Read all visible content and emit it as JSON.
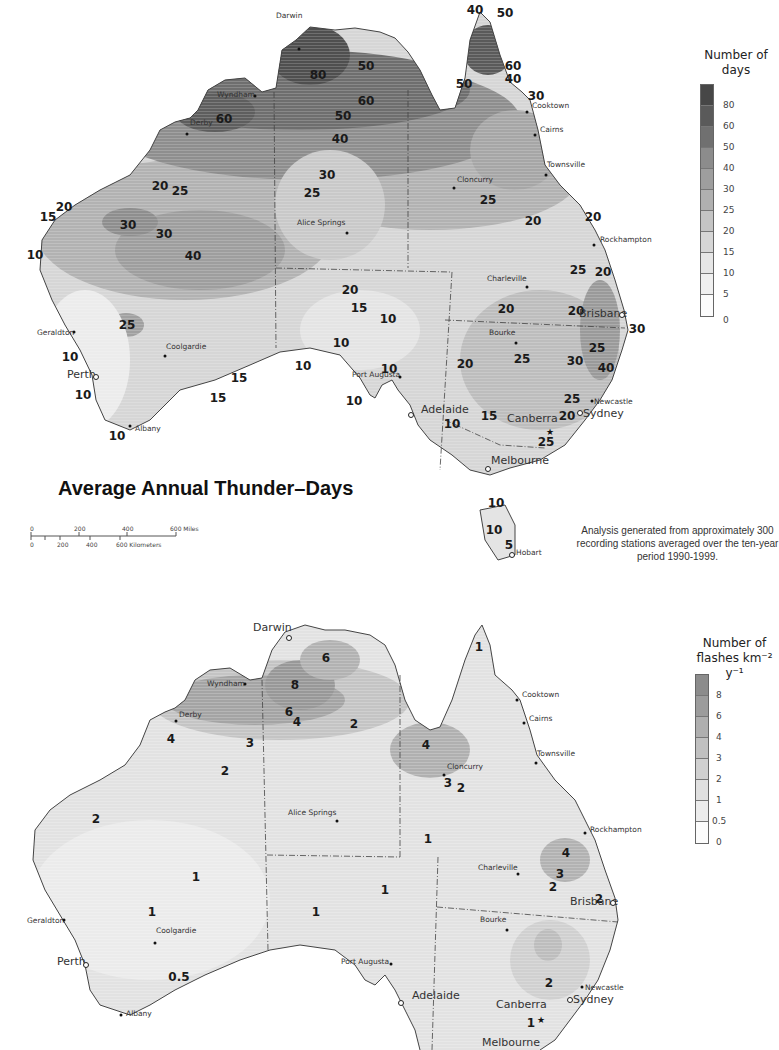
{
  "map1": {
    "title": "Average Annual Thunder–Days",
    "note": "Analysis generated from approximately 300 recording stations averaged over the ten-year period 1990-1999.",
    "legend": {
      "title_line1": "Number of",
      "title_line2": "days",
      "ticks": [
        "80",
        "60",
        "50",
        "40",
        "30",
        "25",
        "20",
        "15",
        "10",
        "5",
        "0"
      ],
      "colors": [
        "#4a4a4a",
        "#5c5c5c",
        "#6e6e6e",
        "#8a8a8a",
        "#9c9c9c",
        "#afafaf",
        "#c2c2c2",
        "#d4d4d4",
        "#e2e2e2",
        "#eeeeee",
        "#fafafa"
      ]
    },
    "scale_bar": {
      "miles_labels": [
        "0",
        "200",
        "400",
        "600 Miles"
      ],
      "km_labels": [
        "0",
        "200",
        "400",
        "600 Kilometers"
      ]
    },
    "contour_labels": [
      {
        "text": "80",
        "x": 318,
        "y": 75
      },
      {
        "text": "50",
        "x": 366,
        "y": 66
      },
      {
        "text": "60",
        "x": 366,
        "y": 101
      },
      {
        "text": "50",
        "x": 343,
        "y": 116
      },
      {
        "text": "40",
        "x": 340,
        "y": 139
      },
      {
        "text": "60",
        "x": 224,
        "y": 119
      },
      {
        "text": "30",
        "x": 327,
        "y": 175
      },
      {
        "text": "25",
        "x": 312,
        "y": 193
      },
      {
        "text": "20",
        "x": 160,
        "y": 186
      },
      {
        "text": "25",
        "x": 180,
        "y": 191
      },
      {
        "text": "20",
        "x": 64,
        "y": 207
      },
      {
        "text": "15",
        "x": 48,
        "y": 217
      },
      {
        "text": "30",
        "x": 128,
        "y": 225
      },
      {
        "text": "30",
        "x": 164,
        "y": 234
      },
      {
        "text": "10",
        "x": 35,
        "y": 255
      },
      {
        "text": "40",
        "x": 193,
        "y": 256
      },
      {
        "text": "40",
        "x": 475,
        "y": 10
      },
      {
        "text": "50",
        "x": 505,
        "y": 13
      },
      {
        "text": "60",
        "x": 513,
        "y": 66
      },
      {
        "text": "40",
        "x": 513,
        "y": 79
      },
      {
        "text": "50",
        "x": 464,
        "y": 84
      },
      {
        "text": "30",
        "x": 536,
        "y": 96
      },
      {
        "text": "25",
        "x": 488,
        "y": 200
      },
      {
        "text": "20",
        "x": 533,
        "y": 221
      },
      {
        "text": "20",
        "x": 593,
        "y": 217
      },
      {
        "text": "25",
        "x": 578,
        "y": 270
      },
      {
        "text": "20",
        "x": 603,
        "y": 272
      },
      {
        "text": "20",
        "x": 506,
        "y": 309
      },
      {
        "text": "20",
        "x": 576,
        "y": 311
      },
      {
        "text": "30",
        "x": 637,
        "y": 329
      },
      {
        "text": "25",
        "x": 597,
        "y": 348
      },
      {
        "text": "25",
        "x": 522,
        "y": 359
      },
      {
        "text": "30",
        "x": 575,
        "y": 361
      },
      {
        "text": "40",
        "x": 606,
        "y": 368
      },
      {
        "text": "20",
        "x": 465,
        "y": 364
      },
      {
        "text": "25",
        "x": 572,
        "y": 399
      },
      {
        "text": "20",
        "x": 567,
        "y": 416
      },
      {
        "text": "15",
        "x": 489,
        "y": 416
      },
      {
        "text": "10",
        "x": 452,
        "y": 424
      },
      {
        "text": "25",
        "x": 546,
        "y": 442
      },
      {
        "text": "20",
        "x": 350,
        "y": 290
      },
      {
        "text": "15",
        "x": 359,
        "y": 308
      },
      {
        "text": "10",
        "x": 388,
        "y": 319
      },
      {
        "text": "10",
        "x": 341,
        "y": 343
      },
      {
        "text": "10",
        "x": 303,
        "y": 366
      },
      {
        "text": "10",
        "x": 389,
        "y": 369
      },
      {
        "text": "10",
        "x": 354,
        "y": 401
      },
      {
        "text": "25",
        "x": 127,
        "y": 325
      },
      {
        "text": "10",
        "x": 70,
        "y": 357
      },
      {
        "text": "10",
        "x": 83,
        "y": 395
      },
      {
        "text": "15",
        "x": 239,
        "y": 378
      },
      {
        "text": "15",
        "x": 218,
        "y": 398
      },
      {
        "text": "10",
        "x": 117,
        "y": 436
      },
      {
        "text": "10",
        "x": 496,
        "y": 503
      },
      {
        "text": "10",
        "x": 494,
        "y": 530
      },
      {
        "text": "5",
        "x": 509,
        "y": 545
      }
    ],
    "cities": [
      {
        "name": "Darwin",
        "x": 276,
        "y": 16,
        "dx": 299,
        "dy": 49,
        "big": false
      },
      {
        "name": "Wyndham",
        "x": 217,
        "y": 95,
        "dx": 255,
        "dy": 96,
        "big": false
      },
      {
        "name": "Derby",
        "x": 190,
        "y": 123,
        "dx": 187,
        "dy": 134,
        "big": false
      },
      {
        "name": "Alice Springs",
        "x": 297,
        "y": 223,
        "dx": 347,
        "dy": 233,
        "big": false
      },
      {
        "name": "Cooktown",
        "x": 532,
        "y": 106,
        "dx": 527,
        "dy": 112,
        "big": false
      },
      {
        "name": "Cairns",
        "x": 540,
        "y": 130,
        "dx": 535,
        "dy": 135,
        "big": false
      },
      {
        "name": "Townsville",
        "x": 547,
        "y": 165,
        "dx": 546,
        "dy": 175,
        "big": false
      },
      {
        "name": "Cloncurry",
        "x": 457,
        "y": 180,
        "dx": 454,
        "dy": 188,
        "big": false
      },
      {
        "name": "Rockhampton",
        "x": 600,
        "y": 240,
        "dx": 594,
        "dy": 245,
        "big": false
      },
      {
        "name": "Charleville",
        "x": 487,
        "y": 279,
        "dx": 527,
        "dy": 287,
        "big": false
      },
      {
        "name": "Brisbane",
        "x": 579,
        "y": 314,
        "dx": 622,
        "dy": 315,
        "big": true,
        "ring": true
      },
      {
        "name": "Bourke",
        "x": 489,
        "y": 333,
        "dx": 516,
        "dy": 343,
        "big": false
      },
      {
        "name": "Geraldton",
        "x": 37,
        "y": 333,
        "dx": 74,
        "dy": 332,
        "big": false
      },
      {
        "name": "Coolgardie",
        "x": 166,
        "y": 347,
        "dx": 165,
        "dy": 356,
        "big": false
      },
      {
        "name": "Perth",
        "x": 67,
        "y": 375,
        "dx": 96,
        "dy": 377,
        "big": true,
        "ring": true
      },
      {
        "name": "Port Augusta",
        "x": 352,
        "y": 375,
        "dx": 400,
        "dy": 377,
        "big": false
      },
      {
        "name": "Adelaide",
        "x": 421,
        "y": 410,
        "dx": 411,
        "dy": 415,
        "big": true,
        "ring": true
      },
      {
        "name": "Newcastle",
        "x": 594,
        "y": 402,
        "dx": 592,
        "dy": 401,
        "big": false
      },
      {
        "name": "Sydney",
        "x": 583,
        "y": 414,
        "dx": 580,
        "dy": 413,
        "big": true,
        "ring": true
      },
      {
        "name": "Canberra",
        "x": 507,
        "y": 419,
        "dx": 550,
        "dy": 432,
        "big": true,
        "star": true
      },
      {
        "name": "Melbourne",
        "x": 491,
        "y": 461,
        "dx": 488,
        "dy": 469,
        "big": true,
        "ring": true
      },
      {
        "name": "Albany",
        "x": 135,
        "y": 429,
        "dx": 130,
        "dy": 426,
        "big": false
      },
      {
        "name": "Hobart",
        "x": 516,
        "y": 553,
        "dx": 512,
        "dy": 555,
        "big": false,
        "ring": true
      }
    ]
  },
  "map2": {
    "legend": {
      "title_line1": "Number of",
      "title_line2": "flashes km⁻² y⁻¹",
      "ticks": [
        "8",
        "6",
        "4",
        "3",
        "2",
        "1",
        "0.5",
        "0"
      ],
      "colors": [
        "#8e8e8e",
        "#9c9c9c",
        "#aeaeae",
        "#bebebe",
        "#cecece",
        "#dddddd",
        "#ebebeb",
        "#fafafa"
      ]
    },
    "contour_labels": [
      {
        "text": "6",
        "x": 326,
        "y": 658
      },
      {
        "text": "8",
        "x": 295,
        "y": 685
      },
      {
        "text": "6",
        "x": 289,
        "y": 712
      },
      {
        "text": "4",
        "x": 297,
        "y": 722
      },
      {
        "text": "2",
        "x": 354,
        "y": 724
      },
      {
        "text": "4",
        "x": 171,
        "y": 739
      },
      {
        "text": "3",
        "x": 250,
        "y": 743
      },
      {
        "text": "2",
        "x": 225,
        "y": 771
      },
      {
        "text": "2",
        "x": 96,
        "y": 819
      },
      {
        "text": "1",
        "x": 479,
        "y": 647
      },
      {
        "text": "4",
        "x": 426,
        "y": 745
      },
      {
        "text": "3",
        "x": 448,
        "y": 783
      },
      {
        "text": "2",
        "x": 461,
        "y": 788
      },
      {
        "text": "1",
        "x": 428,
        "y": 839
      },
      {
        "text": "4",
        "x": 566,
        "y": 853
      },
      {
        "text": "3",
        "x": 560,
        "y": 874
      },
      {
        "text": "2",
        "x": 553,
        "y": 887
      },
      {
        "text": "2",
        "x": 599,
        "y": 899
      },
      {
        "text": "1",
        "x": 196,
        "y": 877
      },
      {
        "text": "1",
        "x": 385,
        "y": 890
      },
      {
        "text": "1",
        "x": 152,
        "y": 912
      },
      {
        "text": "1",
        "x": 316,
        "y": 912
      },
      {
        "text": "0.5",
        "x": 179,
        "y": 977
      },
      {
        "text": "2",
        "x": 549,
        "y": 983
      },
      {
        "text": "1",
        "x": 531,
        "y": 1023
      }
    ],
    "cities": [
      {
        "name": "Darwin",
        "x": 253,
        "y": 628,
        "dx": 289,
        "dy": 638,
        "big": true,
        "ring": true
      },
      {
        "name": "Wyndham",
        "x": 207,
        "y": 684,
        "dx": 245,
        "dy": 684,
        "big": false
      },
      {
        "name": "Derby",
        "x": 179,
        "y": 715,
        "dx": 176,
        "dy": 721,
        "big": false
      },
      {
        "name": "Alice Springs",
        "x": 288,
        "y": 813,
        "dx": 337,
        "dy": 821,
        "big": false
      },
      {
        "name": "Cooktown",
        "x": 522,
        "y": 695,
        "dx": 517,
        "dy": 700,
        "big": false
      },
      {
        "name": "Cairns",
        "x": 529,
        "y": 719,
        "dx": 524,
        "dy": 723,
        "big": false
      },
      {
        "name": "Townsville",
        "x": 537,
        "y": 754,
        "dx": 536,
        "dy": 763,
        "big": false
      },
      {
        "name": "Cloncurry",
        "x": 447,
        "y": 767,
        "dx": 444,
        "dy": 775,
        "big": false
      },
      {
        "name": "Rockhampton",
        "x": 590,
        "y": 830,
        "dx": 585,
        "dy": 833,
        "big": false
      },
      {
        "name": "Charleville",
        "x": 478,
        "y": 868,
        "dx": 518,
        "dy": 874,
        "big": false
      },
      {
        "name": "Brisbane",
        "x": 570,
        "y": 902,
        "dx": 613,
        "dy": 903,
        "big": true,
        "ring": true
      },
      {
        "name": "Bourke",
        "x": 480,
        "y": 920,
        "dx": 507,
        "dy": 930,
        "big": false
      },
      {
        "name": "Geraldton",
        "x": 27,
        "y": 921,
        "dx": 64,
        "dy": 920,
        "big": false
      },
      {
        "name": "Coolgardie",
        "x": 156,
        "y": 931,
        "dx": 155,
        "dy": 943,
        "big": false
      },
      {
        "name": "Perth",
        "x": 57,
        "y": 962,
        "dx": 86,
        "dy": 965,
        "big": true,
        "ring": true
      },
      {
        "name": "Port Augusta",
        "x": 341,
        "y": 962,
        "dx": 391,
        "dy": 964,
        "big": false
      },
      {
        "name": "Adelaide",
        "x": 412,
        "y": 996,
        "dx": 401,
        "dy": 1003,
        "big": true,
        "ring": true
      },
      {
        "name": "Newcastle",
        "x": 585,
        "y": 988,
        "dx": 582,
        "dy": 987,
        "big": false
      },
      {
        "name": "Sydney",
        "x": 573,
        "y": 1000,
        "dx": 570,
        "dy": 1000,
        "big": true,
        "ring": true
      },
      {
        "name": "Canberra",
        "x": 496,
        "y": 1005,
        "dx": 541,
        "dy": 1020,
        "big": true,
        "star": true
      },
      {
        "name": "Albany",
        "x": 126,
        "y": 1014,
        "dx": 121,
        "dy": 1015,
        "big": false
      },
      {
        "name": "Melbourne",
        "x": 482,
        "y": 1043,
        "dx": 0,
        "dy": 0,
        "big": true
      }
    ]
  }
}
